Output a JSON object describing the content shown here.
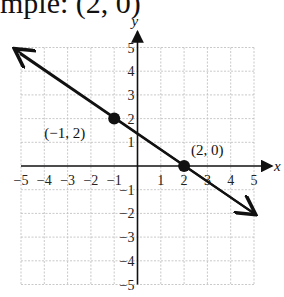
{
  "header": {
    "title_fragment": "mple: (2, 0)"
  },
  "chart_data": {
    "type": "line",
    "title": "mple: (2, 0)",
    "xlabel": "x",
    "ylabel": "y",
    "xlim": [
      -5,
      5
    ],
    "ylim": [
      -5,
      5
    ],
    "grid": true,
    "x_ticks": [
      "−5",
      "−4",
      "−3",
      "−2",
      "−1",
      "1",
      "2",
      "3",
      "4",
      "5"
    ],
    "y_ticks": [
      "5",
      "4",
      "3",
      "2",
      "1",
      "−1",
      "−2",
      "−3",
      "−4",
      "−5"
    ],
    "line": {
      "slope": -0.6667,
      "intercept": 1.3333,
      "from": [
        -5.3,
        4.9
      ],
      "to": [
        5,
        -2
      ]
    },
    "points": [
      {
        "x": -1,
        "y": 2,
        "label": "(−1, 2)"
      },
      {
        "x": 2,
        "y": 0,
        "label": "(2, 0)"
      }
    ]
  }
}
